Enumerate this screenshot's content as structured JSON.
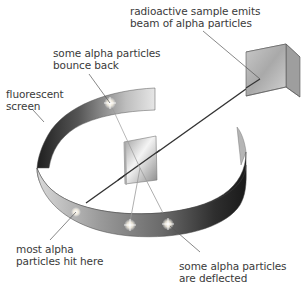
{
  "labels": {
    "source": {
      "line1": "radioactive sample emits",
      "line2": "beam of alpha particles"
    },
    "bounce": {
      "line1": "some alpha particles",
      "line2": "bounce back"
    },
    "screen": {
      "line1": "fluorescent",
      "line2": "screen"
    },
    "most": {
      "line1": "most alpha",
      "line2": "particles hit here"
    },
    "deflected": {
      "line1": "some alpha particles",
      "line2": "are deflected"
    }
  },
  "components": [
    "radioactive-source-cube",
    "gold-foil",
    "fluorescent-screen-ring",
    "alpha-beam",
    "flash-points"
  ],
  "colors": {
    "leader_line": "#555555",
    "beam": "#333333",
    "text": "#3a3a3a"
  }
}
